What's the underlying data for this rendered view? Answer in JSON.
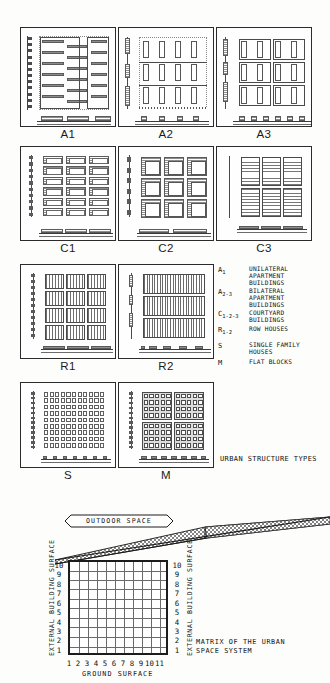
{
  "document": {
    "type": "urban-structure-types-plate",
    "background": "#fdfdfc",
    "ink": "#1c1c1c"
  },
  "panels": [
    {
      "id": "A1",
      "label": "A1",
      "pattern": "unilateral-slab-rows"
    },
    {
      "id": "A2",
      "label": "A2",
      "pattern": "bilateral-point-blocks"
    },
    {
      "id": "A3",
      "label": "A3",
      "pattern": "bilateral-paired-blocks"
    },
    {
      "id": "C1",
      "label": "C1",
      "pattern": "courtyard-small-3x6"
    },
    {
      "id": "C2",
      "label": "C2",
      "pattern": "courtyard-large-3x3"
    },
    {
      "id": "C3",
      "label": "C3",
      "pattern": "courtyard-dense-grid"
    },
    {
      "id": "R1",
      "label": "R1",
      "pattern": "row-houses-coarse"
    },
    {
      "id": "R2",
      "label": "R2",
      "pattern": "row-houses-fine"
    },
    {
      "id": "S",
      "label": "S",
      "pattern": "single-family-cells"
    },
    {
      "id": "M",
      "label": "M",
      "pattern": "flat-block-cells"
    }
  ],
  "legend": {
    "title": "URBAN STRUCTURE TYPES",
    "entries": [
      {
        "symbol": "A",
        "sub": "1",
        "text": "UNILATERAL\nAPARTMENT\nBUILDINGS"
      },
      {
        "symbol": "A",
        "sub": "2-3",
        "text": "BILATERAL\nAPARTMENT\nBUILDINGS"
      },
      {
        "symbol": "C",
        "sub": "1-2-3",
        "text": "COURTYARD\nBUILDINGS"
      },
      {
        "symbol": "R",
        "sub": "1-2",
        "text": "ROW HOUSES"
      },
      {
        "symbol": "S",
        "sub": "",
        "text": "SINGLE FAMILY\nHOUSES"
      },
      {
        "symbol": "M",
        "sub": "",
        "text": "FLAT BLOCKS"
      }
    ]
  },
  "chart_data": {
    "type": "heatmap",
    "title": "MATRIX OF THE URBAN\nSPACE SYSTEM",
    "banner": "OUTDOOR SPACE",
    "xlabel": "GROUND SURFACE",
    "ylabel_left": "EXTERNAL BUILDING SURFACE",
    "ylabel_right": "EXTERNAL BUILDING SURFACE",
    "x_ticks": [
      "1",
      "2",
      "3",
      "4",
      "5",
      "6",
      "7",
      "8",
      "9",
      "10",
      "11"
    ],
    "y_ticks_left": [
      "1",
      "2",
      "3",
      "4",
      "5",
      "6",
      "7",
      "8",
      "9",
      "10"
    ],
    "y_ticks_right": [
      "1",
      "2",
      "3",
      "4",
      "5",
      "6",
      "7",
      "8",
      "9",
      "10"
    ],
    "xlim": [
      1,
      11
    ],
    "ylim": [
      1,
      10
    ],
    "grid": true,
    "legend_position": "none",
    "annotations": [
      {
        "text": "OUTDOOR SPACE",
        "shape": "hexagon-banner"
      },
      {
        "text": "MATRIX OF THE URBAN SPACE SYSTEM",
        "position": "right-of-axis"
      }
    ]
  }
}
